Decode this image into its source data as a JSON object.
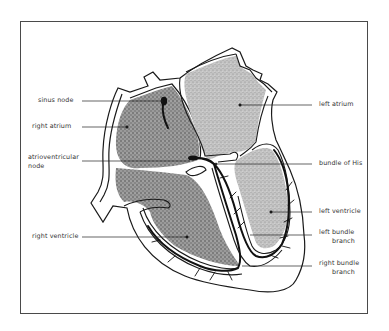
{
  "diagram": {
    "type": "anatomical-diagram",
    "labels_left": [
      {
        "id": "sinus_node",
        "text": "sinus node"
      },
      {
        "id": "right_atrium",
        "text": "right atrium"
      },
      {
        "id": "av_node_line1",
        "text": "atrioventricular"
      },
      {
        "id": "av_node_line2",
        "text": "node"
      },
      {
        "id": "right_ventricle",
        "text": "right ventricle"
      }
    ],
    "labels_right": [
      {
        "id": "left_atrium",
        "text": "left atrium"
      },
      {
        "id": "bundle_of_his",
        "text": "bundle of His"
      },
      {
        "id": "left_ventricle",
        "text": "left ventricle"
      },
      {
        "id": "left_bundle_line1",
        "text": "left bundle"
      },
      {
        "id": "left_bundle_line2",
        "text": "branch"
      },
      {
        "id": "right_bundle_line1",
        "text": "right bundle"
      },
      {
        "id": "right_bundle_line2",
        "text": "branch"
      }
    ],
    "colors": {
      "outline": "#1a1a1a",
      "fill_dark": "#7a7a7a",
      "fill_light": "#b9b9b9",
      "frame": "#4a4a4a",
      "background": "#ffffff"
    }
  }
}
